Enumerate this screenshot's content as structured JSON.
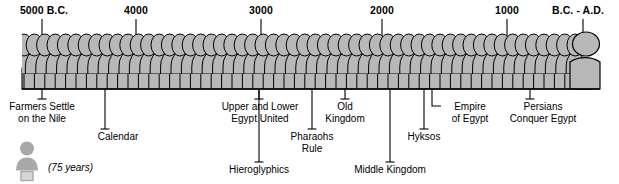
{
  "figure": {
    "colors": {
      "bar_fill": "#b8b8b8",
      "bar_fill_light": "#c9c9c9",
      "outline": "#000000",
      "leader": "#000000",
      "person_icon": "#a8a8a8",
      "background": "#ffffff"
    }
  },
  "axis": {
    "direction": "left-to-right, oldest to newest",
    "ticks": [
      {
        "label": "5000 B.C.",
        "x": 42,
        "label_x": 44,
        "label_anchor": "middle"
      },
      {
        "label": "4000",
        "x": 136,
        "label_x": 136,
        "label_anchor": "middle"
      },
      {
        "label": "3000",
        "x": 261,
        "label_x": 261,
        "label_anchor": "middle"
      },
      {
        "label": "2000",
        "x": 382,
        "label_x": 382,
        "label_anchor": "middle"
      },
      {
        "label": "1000",
        "x": 507,
        "label_x": 507,
        "label_anchor": "middle"
      },
      {
        "label": "B.C. - A.D.",
        "x": 583,
        "label_x": 578,
        "label_anchor": "middle"
      }
    ]
  },
  "events": [
    {
      "name": "farmers-settle-on-the-nile",
      "lines": [
        "Farmers Settle",
        "on the Nile"
      ],
      "anchor_x": 42,
      "label_x": 42,
      "label_y": 101,
      "drop_y": 99,
      "tick": "horizontal"
    },
    {
      "name": "calendar",
      "lines": [
        "Calendar"
      ],
      "anchor_x": 105,
      "label_x": 118,
      "label_y": 131,
      "drop_y": 129,
      "tick": "horizontal"
    },
    {
      "name": "upper-and-lower-egypt-united",
      "lines": [
        "Upper and Lower",
        "Egypt United"
      ],
      "anchor_x": 259,
      "label_x": 260,
      "label_y": 101,
      "drop_y": 99,
      "tick": "horizontal"
    },
    {
      "name": "hieroglyphics",
      "lines": [
        "Hieroglyphics"
      ],
      "anchor_x": 259,
      "label_x": 259,
      "label_y": 164,
      "drop_y": 162,
      "tick": "horizontal"
    },
    {
      "name": "pharaohs-rule",
      "lines": [
        "Pharaohs",
        "Rule"
      ],
      "anchor_x": 312,
      "label_x": 312,
      "label_y": 131,
      "drop_y": 129,
      "tick": "horizontal"
    },
    {
      "name": "old-kingdom",
      "lines": [
        "Old",
        "Kingdom"
      ],
      "anchor_x": 345,
      "label_x": 345,
      "label_y": 101,
      "drop_y": 99,
      "tick": "horizontal"
    },
    {
      "name": "middle-kingdom",
      "lines": [
        "Middle Kingdom"
      ],
      "anchor_x": 390,
      "label_x": 390,
      "label_y": 164,
      "drop_y": 162,
      "tick": "horizontal"
    },
    {
      "name": "hyksos",
      "lines": [
        "Hyksos"
      ],
      "anchor_x": 424,
      "label_x": 424,
      "label_y": 131,
      "drop_y": 129,
      "tick": "horizontal"
    },
    {
      "name": "empire-of-egypt",
      "lines": [
        "Empire",
        "of Egypt"
      ],
      "anchor_x": 432,
      "label_x": 470,
      "label_y": 101,
      "drop_y": 99,
      "tick": "elbow-right"
    },
    {
      "name": "persians-conquer-egypt",
      "lines": [
        "Persians",
        "Conquer Egypt"
      ],
      "anchor_x": 530,
      "label_x": 543,
      "label_y": 101,
      "drop_y": 99,
      "tick": "horizontal"
    }
  ],
  "legend": {
    "icon": "person-icon",
    "note": "(75 years)"
  }
}
